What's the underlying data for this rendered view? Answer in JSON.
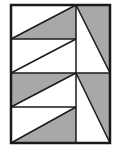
{
  "diagram": {
    "colors": {
      "stroke": "#1a1a1a",
      "shade": "#a8a8a8",
      "background": "#ffffff"
    },
    "outer": {
      "x": 11,
      "y": 5,
      "w": 99,
      "h": 138
    },
    "lines": [
      [
        76,
        5,
        76,
        143
      ],
      [
        11,
        39,
        76,
        39
      ],
      [
        11,
        73,
        110,
        73
      ],
      [
        11,
        107,
        76,
        107
      ],
      [
        11,
        39,
        76,
        5
      ],
      [
        11,
        73,
        76,
        39
      ],
      [
        11,
        107,
        76,
        73
      ],
      [
        11,
        143,
        76,
        107
      ],
      [
        76,
        5,
        110,
        73
      ],
      [
        76,
        73,
        110,
        143
      ]
    ],
    "shaded": [
      "11,39 76,5 76,39",
      "11,73 76,73 11,107",
      "11,143 76,107 76,143",
      "76,5 110,5 110,73",
      "76,73 110,73 110,143"
    ]
  }
}
